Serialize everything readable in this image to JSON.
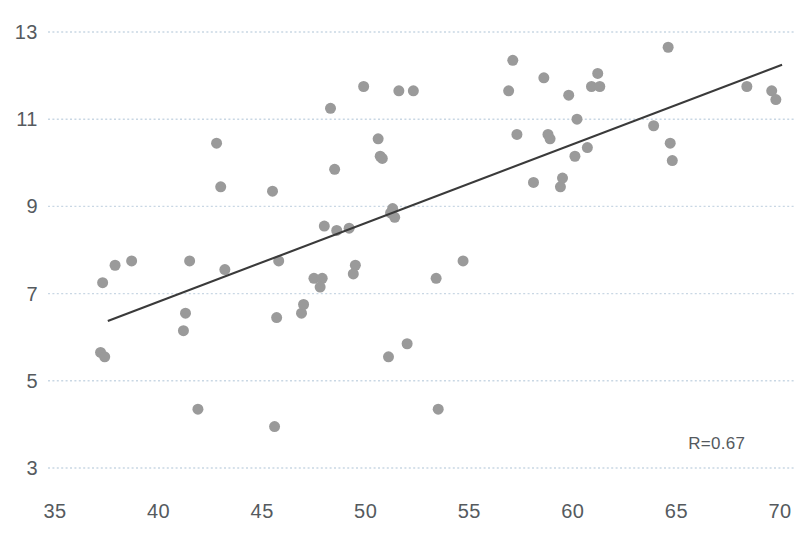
{
  "chart_data": {
    "type": "scatter",
    "title": "",
    "xlabel": "",
    "ylabel": "",
    "xlim": [
      35,
      70
    ],
    "ylim": [
      3,
      13
    ],
    "xticks": [
      35,
      40,
      45,
      50,
      55,
      60,
      65,
      70
    ],
    "yticks": [
      3,
      5,
      7,
      9,
      11,
      13
    ],
    "grid": "horizontal-dotted",
    "legend": null,
    "annotations": [
      {
        "name": "correlation",
        "text": "R=0.67",
        "x": 67.5,
        "y": 3.55
      }
    ],
    "series": [
      {
        "name": "observations",
        "type": "scatter",
        "marker_color": "#9a9a9a",
        "marker_size": 11,
        "points": [
          [
            37.2,
            5.65
          ],
          [
            37.4,
            5.55
          ],
          [
            37.3,
            7.25
          ],
          [
            37.9,
            7.65
          ],
          [
            38.7,
            7.75
          ],
          [
            41.3,
            6.55
          ],
          [
            41.2,
            6.15
          ],
          [
            41.5,
            7.75
          ],
          [
            41.9,
            4.35
          ],
          [
            42.8,
            10.45
          ],
          [
            43.0,
            9.45
          ],
          [
            43.2,
            7.55
          ],
          [
            45.5,
            9.35
          ],
          [
            45.7,
            6.45
          ],
          [
            45.8,
            7.75
          ],
          [
            45.6,
            3.95
          ],
          [
            46.9,
            6.55
          ],
          [
            47.0,
            6.75
          ],
          [
            47.5,
            7.35
          ],
          [
            47.9,
            7.35
          ],
          [
            47.8,
            7.15
          ],
          [
            48.0,
            8.55
          ],
          [
            48.3,
            11.25
          ],
          [
            48.5,
            9.85
          ],
          [
            48.6,
            8.45
          ],
          [
            49.2,
            8.5
          ],
          [
            49.5,
            7.65
          ],
          [
            49.4,
            7.45
          ],
          [
            49.9,
            11.75
          ],
          [
            50.6,
            10.55
          ],
          [
            50.7,
            10.15
          ],
          [
            50.8,
            10.1
          ],
          [
            51.3,
            8.95
          ],
          [
            51.2,
            8.85
          ],
          [
            51.4,
            8.75
          ],
          [
            51.1,
            5.55
          ],
          [
            51.6,
            11.65
          ],
          [
            52.0,
            5.85
          ],
          [
            52.3,
            11.65
          ],
          [
            53.4,
            7.35
          ],
          [
            53.5,
            4.35
          ],
          [
            54.7,
            7.75
          ],
          [
            56.9,
            11.65
          ],
          [
            57.1,
            12.35
          ],
          [
            57.3,
            10.65
          ],
          [
            58.1,
            9.55
          ],
          [
            58.6,
            11.95
          ],
          [
            58.8,
            10.65
          ],
          [
            58.9,
            10.55
          ],
          [
            59.4,
            9.45
          ],
          [
            59.5,
            9.65
          ],
          [
            59.8,
            11.55
          ],
          [
            60.1,
            10.15
          ],
          [
            60.2,
            11.0
          ],
          [
            60.7,
            10.35
          ],
          [
            60.9,
            11.75
          ],
          [
            61.2,
            12.05
          ],
          [
            61.3,
            11.75
          ],
          [
            63.9,
            10.85
          ],
          [
            64.6,
            12.65
          ],
          [
            64.7,
            10.45
          ],
          [
            64.8,
            10.05
          ],
          [
            68.4,
            11.75
          ],
          [
            69.6,
            11.65
          ],
          [
            69.8,
            11.45
          ]
        ]
      }
    ],
    "trendline": {
      "name": "linear-fit",
      "color": "#3a3a3a",
      "x_start": 37.55,
      "y_start": 6.37,
      "x_end": 70.1,
      "y_end": 12.25
    }
  },
  "axes": {
    "y_tick_labels": [
      "13",
      "11",
      "9",
      "7",
      "5",
      "3"
    ],
    "x_tick_labels": [
      "35",
      "40",
      "45",
      "50",
      "55",
      "60",
      "65",
      "70"
    ]
  },
  "style": {
    "grid_color": "#c9d7e4",
    "marker_color": "#9a9a9a",
    "trendline_color": "#3a3a3a",
    "tick_label_color": "#555a5e",
    "background": "#ffffff"
  }
}
